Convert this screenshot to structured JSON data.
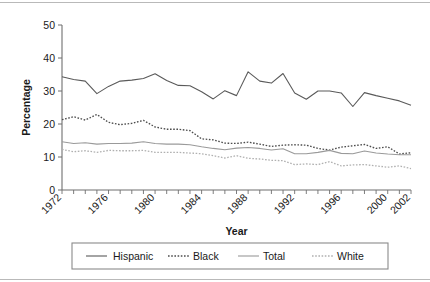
{
  "chart_data": {
    "type": "line",
    "title": "",
    "xlabel": "Year",
    "ylabel": "Percentage",
    "xlim": [
      1972,
      2002
    ],
    "ylim": [
      0,
      50
    ],
    "yticks": [
      0,
      10,
      20,
      30,
      40,
      50
    ],
    "xticks_labeled": [
      1972,
      1976,
      1980,
      1984,
      1988,
      1992,
      1996,
      2000,
      2002
    ],
    "xticks_all": [
      1972,
      1973,
      1974,
      1975,
      1976,
      1977,
      1978,
      1979,
      1980,
      1981,
      1982,
      1983,
      1984,
      1985,
      1986,
      1987,
      1988,
      1989,
      1990,
      1991,
      1992,
      1993,
      1994,
      1995,
      1996,
      1997,
      1998,
      1999,
      2000,
      2001,
      2002
    ],
    "grid": false,
    "legend_position": "bottom",
    "x": [
      1972,
      1973,
      1974,
      1975,
      1976,
      1977,
      1978,
      1979,
      1980,
      1981,
      1982,
      1983,
      1984,
      1985,
      1986,
      1987,
      1988,
      1989,
      1990,
      1991,
      1992,
      1993,
      1994,
      1995,
      1996,
      1997,
      1998,
      1999,
      2000,
      2001,
      2002
    ],
    "series": [
      {
        "name": "Hispanic",
        "style": "solid",
        "color": "#5a5a5a",
        "width": 1.1,
        "values": [
          34.3,
          33.5,
          33.0,
          29.2,
          31.4,
          33.0,
          33.3,
          33.8,
          35.2,
          33.2,
          31.7,
          31.6,
          29.8,
          27.6,
          30.1,
          28.6,
          35.8,
          33.0,
          32.4,
          35.3,
          29.4,
          27.5,
          30.0,
          30.0,
          29.4,
          25.3,
          29.5,
          28.6,
          27.8,
          27.0,
          25.7
        ]
      },
      {
        "name": "Black",
        "style": "dotted",
        "color": "#4d4d4d",
        "width": 1.35,
        "values": [
          21.3,
          22.2,
          21.2,
          22.9,
          20.5,
          19.8,
          20.2,
          21.1,
          19.1,
          18.4,
          18.4,
          18.0,
          15.5,
          15.2,
          14.2,
          14.1,
          14.5,
          13.9,
          13.2,
          13.6,
          13.7,
          13.6,
          12.6,
          12.1,
          13.0,
          13.4,
          13.8,
          12.6,
          13.1,
          10.9,
          11.3
        ]
      },
      {
        "name": "Total",
        "style": "solid",
        "color": "#9a9a9a",
        "width": 1.1,
        "values": [
          14.6,
          14.1,
          14.3,
          13.9,
          14.1,
          14.1,
          14.2,
          14.6,
          14.1,
          13.9,
          13.9,
          13.7,
          13.1,
          12.6,
          12.2,
          12.7,
          12.9,
          12.6,
          12.1,
          12.5,
          11.0,
          11.0,
          11.4,
          12.0,
          11.1,
          11.0,
          11.8,
          11.2,
          10.9,
          10.7,
          10.7
        ]
      },
      {
        "name": "White",
        "style": "dotted",
        "color": "#b0b0b0",
        "width": 1.3,
        "values": [
          12.3,
          11.6,
          11.9,
          11.4,
          12.0,
          11.9,
          11.9,
          12.0,
          11.4,
          11.4,
          11.4,
          11.2,
          11.0,
          10.4,
          9.7,
          10.4,
          9.6,
          9.4,
          9.0,
          8.9,
          7.7,
          7.9,
          7.7,
          8.6,
          7.3,
          7.6,
          7.7,
          7.3,
          6.9,
          7.3,
          6.5
        ]
      }
    ]
  },
  "legend": {
    "items": [
      {
        "label": "Hispanic"
      },
      {
        "label": "Black"
      },
      {
        "label": "Total"
      },
      {
        "label": "White"
      }
    ]
  },
  "axis": {
    "y_title": "Percentage",
    "x_title": "Year"
  }
}
